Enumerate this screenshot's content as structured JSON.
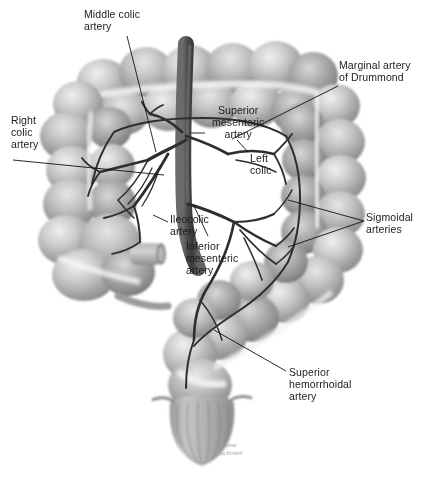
{
  "figure": {
    "type": "anatomical-illustration",
    "style": "grayscale pencil/wash medical illustration",
    "background_color": "#ffffff",
    "ink_color": "#1b1b1b",
    "width": 422,
    "height": 479
  },
  "labels": [
    {
      "id": "middle-colic",
      "text": "Middle colic\nartery",
      "x": 84,
      "y": 8
    },
    {
      "id": "right-colic",
      "text": "Right\ncolic\nartery",
      "x": 11,
      "y": 114
    },
    {
      "id": "superior-mesenteric",
      "text": "Superior\nmesenteric\nartery",
      "x": 212,
      "y": 104
    },
    {
      "id": "marginal-drummond",
      "text": "Marginal artery\nof Drummond",
      "x": 339,
      "y": 59
    },
    {
      "id": "left-colic",
      "text": "Left\ncolic",
      "x": 250,
      "y": 152
    },
    {
      "id": "ileocolic",
      "text": "Ileocolic\nartery",
      "x": 170,
      "y": 213
    },
    {
      "id": "inferior-mesenteric",
      "text": "Inferior\nmesenteric\nartery",
      "x": 186,
      "y": 240
    },
    {
      "id": "sigmoidal",
      "text": "Sigmoidal\narteries",
      "x": 366,
      "y": 211
    },
    {
      "id": "superior-hemorrhoidal",
      "text": "Superior\nhemorrhoidal\nartery",
      "x": 289,
      "y": 366
    }
  ],
  "signature": {
    "text": "Anna\nCochrane",
    "x": 215,
    "y": 441
  },
  "anatomy": {
    "structures": [
      "transverse colon",
      "ascending colon",
      "cecum",
      "ileum stump",
      "descending colon",
      "sigmoid colon",
      "rectum",
      "abdominal aorta",
      "mesenteric arterial arcade"
    ]
  }
}
